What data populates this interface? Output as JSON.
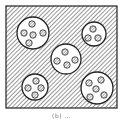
{
  "figure": {
    "type": "schematic",
    "caption": "(b) …",
    "colors": {
      "stroke": "#222222",
      "background": "#ffffff",
      "hatch": "#333333"
    },
    "frame": {
      "x": 6,
      "y": 6,
      "width": 111,
      "height": 102
    },
    "domains": [
      {
        "id": "top-left",
        "cx": 33,
        "cy": 33,
        "r": 16,
        "particles": [
          {
            "cx": 32,
            "cy": 24
          },
          {
            "cx": 24,
            "cy": 33
          },
          {
            "cx": 33,
            "cy": 35
          },
          {
            "cx": 43,
            "cy": 33
          },
          {
            "cx": 29,
            "cy": 43
          }
        ]
      },
      {
        "id": "top-right",
        "cx": 94,
        "cy": 34,
        "r": 12,
        "particles": [
          {
            "cx": 93,
            "cy": 29
          },
          {
            "cx": 88,
            "cy": 38
          },
          {
            "cx": 98,
            "cy": 38
          }
        ]
      },
      {
        "id": "center",
        "cx": 66,
        "cy": 59,
        "r": 15,
        "particles": [
          {
            "cx": 65,
            "cy": 52
          },
          {
            "cx": 57,
            "cy": 61
          },
          {
            "cx": 67,
            "cy": 65
          },
          {
            "cx": 75,
            "cy": 60
          }
        ]
      },
      {
        "id": "bottom-left",
        "cx": 35,
        "cy": 87,
        "r": 13,
        "particles": [
          {
            "cx": 36,
            "cy": 81
          },
          {
            "cx": 28,
            "cy": 88
          },
          {
            "cx": 41,
            "cy": 88
          },
          {
            "cx": 35,
            "cy": 95
          }
        ]
      },
      {
        "id": "bottom-right",
        "cx": 97,
        "cy": 88,
        "r": 16,
        "particles": [
          {
            "cx": 89,
            "cy": 83
          },
          {
            "cx": 101,
            "cy": 80
          },
          {
            "cx": 96,
            "cy": 89
          },
          {
            "cx": 90,
            "cy": 97
          },
          {
            "cx": 104,
            "cy": 95
          }
        ]
      }
    ],
    "particle_radius": 3.2
  }
}
